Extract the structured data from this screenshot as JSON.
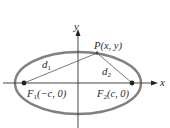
{
  "diagram": {
    "type": "ellipse-foci",
    "axes": {
      "x_label": "x",
      "y_label": "y"
    },
    "point": {
      "label": "P(x, y)"
    },
    "foci": [
      {
        "name": "F",
        "sub": "1",
        "coords": "(−c, 0)"
      },
      {
        "name": "F",
        "sub": "2",
        "coords": "(c, 0)"
      }
    ],
    "distances": [
      {
        "name": "d",
        "sub": "1"
      },
      {
        "name": "d",
        "sub": "2"
      }
    ],
    "colors": {
      "ellipse": "#808080",
      "axes": "#333333",
      "lines": "#555555",
      "dots": "#222222"
    }
  }
}
